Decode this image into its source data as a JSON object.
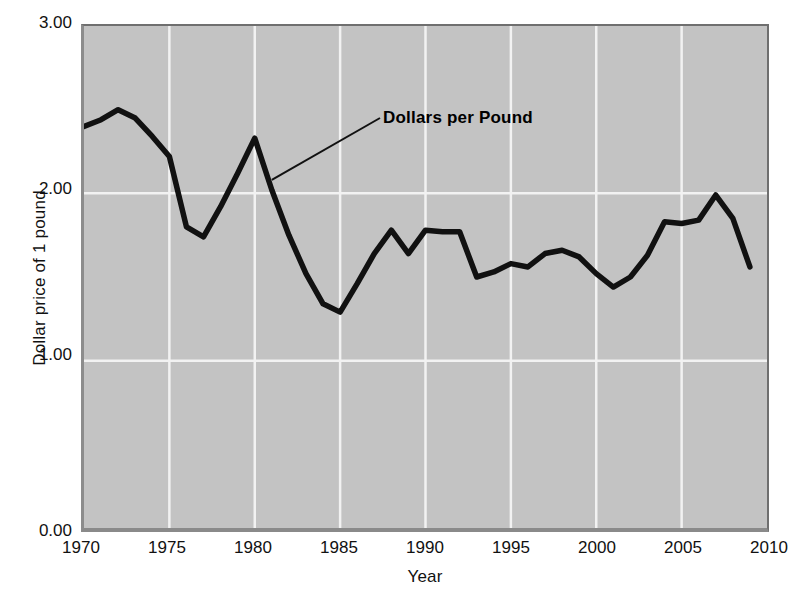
{
  "chart_data": {
    "type": "line",
    "title": "",
    "xlabel": "Year",
    "ylabel": "Dollar price of 1 pound",
    "xlim": [
      1970,
      2010
    ],
    "ylim": [
      0.0,
      3.0
    ],
    "xticks": [
      "1970",
      "1975",
      "1980",
      "1985",
      "1990",
      "1995",
      "2000",
      "2005",
      "2010"
    ],
    "yticks": [
      "0.00",
      "1.00",
      "2.00",
      "3.00"
    ],
    "grid": true,
    "legend_position": "inline-annotation",
    "annotations": [
      {
        "text": "Dollars per Pound",
        "points_to_year": 1981,
        "points_to_value": 2.08
      }
    ],
    "series": [
      {
        "name": "Dollars per Pound",
        "color": "#111111",
        "x": [
          1970,
          1971,
          1972,
          1973,
          1974,
          1975,
          1976,
          1977,
          1978,
          1979,
          1980,
          1981,
          1982,
          1983,
          1984,
          1985,
          1986,
          1987,
          1988,
          1989,
          1990,
          1991,
          1992,
          1993,
          1994,
          1995,
          1996,
          1997,
          1998,
          1999,
          2000,
          2001,
          2002,
          2003,
          2004,
          2005,
          2006,
          2007,
          2008,
          2009
        ],
        "values": [
          2.4,
          2.44,
          2.5,
          2.45,
          2.34,
          2.22,
          1.8,
          1.74,
          1.92,
          2.12,
          2.33,
          2.02,
          1.75,
          1.52,
          1.34,
          1.29,
          1.46,
          1.64,
          1.78,
          1.64,
          1.78,
          1.77,
          1.77,
          1.5,
          1.53,
          1.58,
          1.56,
          1.64,
          1.66,
          1.62,
          1.52,
          1.44,
          1.5,
          1.63,
          1.83,
          1.82,
          1.84,
          1.99,
          1.85,
          1.56
        ]
      }
    ]
  }
}
